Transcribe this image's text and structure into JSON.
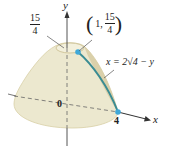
{
  "figure": {
    "surface_color": "#ece8cf",
    "surface_edge_color": "#c9bc8e",
    "curve_color": "#3a8c93",
    "point_color": "#3fa8d8",
    "axis_color": "#555555"
  },
  "labels": {
    "y_axis": "y",
    "x_axis": "x",
    "origin": "0",
    "x_intercept": "4",
    "top_value": {
      "numerator": "15",
      "denominator": "4"
    },
    "point": {
      "open": "(",
      "x": "1,",
      "numerator": "15",
      "denominator": "4",
      "close": ")"
    },
    "curve_equation": "x = 2√4 − y"
  }
}
